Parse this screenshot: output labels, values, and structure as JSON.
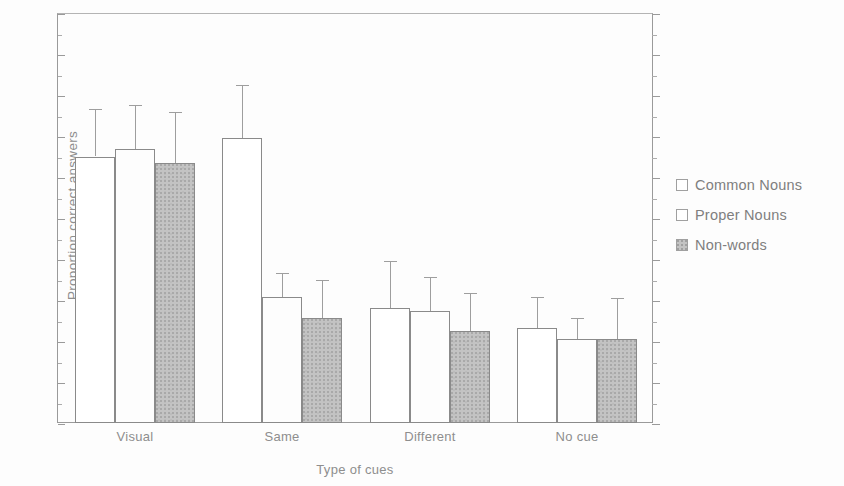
{
  "chart_data": {
    "type": "bar",
    "title": "",
    "xlabel": "Type of cues",
    "ylabel": "Proportion correct answers",
    "categories": [
      "Visual",
      "Same",
      "Different",
      "No cue"
    ],
    "ylim": [
      0,
      1
    ],
    "ytick_labels": [
      "0",
      ".1",
      ".2",
      ".3",
      ".4",
      ".5",
      ".6",
      ".7",
      ".8",
      ".9",
      "1"
    ],
    "ytick_values": [
      0,
      0.1,
      0.2,
      0.3,
      0.4,
      0.5,
      0.6,
      0.7,
      0.8,
      0.9,
      1.0
    ],
    "grid": false,
    "legend_position": "right",
    "series": [
      {
        "name": "Common Nouns",
        "fill": "white",
        "values": [
          0.65,
          0.695,
          0.28,
          0.232
        ],
        "error_upper": [
          0.765,
          0.825,
          0.395,
          0.307
        ]
      },
      {
        "name": "Proper Nouns",
        "fill": "white",
        "values": [
          0.668,
          0.307,
          0.273,
          0.205
        ],
        "error_upper": [
          0.775,
          0.365,
          0.357,
          0.255
        ]
      },
      {
        "name": "Non-words",
        "fill": "gray-stipple",
        "values": [
          0.635,
          0.257,
          0.225,
          0.205
        ],
        "error_upper": [
          0.758,
          0.348,
          0.317,
          0.305
        ]
      }
    ]
  },
  "legend": {
    "items": [
      {
        "label": "Common Nouns",
        "swatch": "open-square-icon"
      },
      {
        "label": "Proper Nouns",
        "swatch": "open-square-icon"
      },
      {
        "label": "Non-words",
        "swatch": "filled-square-icon"
      }
    ]
  },
  "axes": {
    "y_title": "Proportion correct answers",
    "x_title": "Type of cues"
  }
}
